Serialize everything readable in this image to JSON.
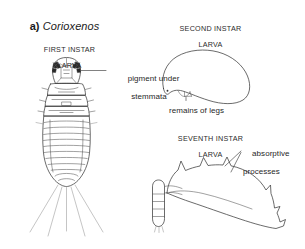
{
  "figure": {
    "panel_label": "a)",
    "taxon_name": "Corioxenos",
    "background_color": "#ffffff",
    "ink_color": "#3a3a3a"
  },
  "stages": [
    {
      "id": "first-instar",
      "heading_line1": "FIRST INSTAR",
      "heading_line2": "LARVA",
      "callout": {
        "id": "pigment-under-stemmata",
        "line1": "pigment under",
        "line2": "stemmata"
      }
    },
    {
      "id": "second-instar",
      "heading_line1": "SECOND INSTAR",
      "heading_line2": "LARVA",
      "callout": {
        "id": "remains-of-legs",
        "line1": "remains of legs",
        "line2": ""
      }
    },
    {
      "id": "seventh-instar",
      "heading_line1": "SEVENTH INSTAR",
      "heading_line2": "LARVA",
      "callout": {
        "id": "absorptive-processes",
        "line1": "absorptive",
        "line2": "processes"
      }
    }
  ]
}
